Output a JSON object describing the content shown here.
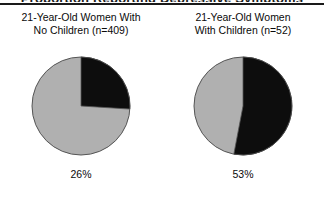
{
  "figure": {
    "clipped_header_text": "Proportion Reporting Depressive Symptoms",
    "background_color": "#ffffff",
    "slice_colors": {
      "highlight": "#0d0d0d",
      "remainder": "#b0b0b0",
      "outline": "#555555"
    }
  },
  "chart_data": {
    "type": "pie",
    "title": "",
    "panels": [
      {
        "title": "21-Year-Old Women With\nNo Children (n=409)",
        "group_label": "21-Year-Old Women With No Children",
        "n": 409,
        "value_label": "26%",
        "categories": [
          "Yes",
          "No"
        ],
        "values": [
          26,
          74
        ],
        "colors": [
          "#0d0d0d",
          "#b0b0b0"
        ],
        "start_angle_deg": 0,
        "highlight_sweep_deg": 93.6
      },
      {
        "title": "21-Year-Old Women\nWith Children (n=52)",
        "group_label": "21-Year-Old Women With Children",
        "n": 52,
        "value_label": "53%",
        "categories": [
          "Yes",
          "No"
        ],
        "values": [
          53,
          47
        ],
        "colors": [
          "#0d0d0d",
          "#b0b0b0"
        ],
        "start_angle_deg": 0,
        "highlight_sweep_deg": 190.8
      }
    ],
    "legend": null,
    "grid": false,
    "xlabel": "",
    "ylabel": ""
  }
}
